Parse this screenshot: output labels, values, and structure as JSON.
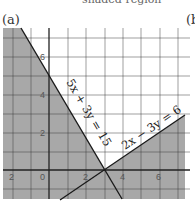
{
  "header": {
    "top_text": "shaded region",
    "panel_a_label": "(a)",
    "panel_b_label": "(b"
  },
  "colors": {
    "shade": "#a8a8a8",
    "grid": "#3a3a3a",
    "line": "#1a1a1a",
    "background": "#ffffff"
  },
  "graph": {
    "x_ticks": [
      "2",
      "0",
      "2",
      "4",
      "6"
    ],
    "y_ticks": [
      "6",
      "4",
      "2"
    ],
    "lines": [
      {
        "label": "5x + 3y = 15"
      },
      {
        "label": "2x − 3y = 6"
      }
    ]
  }
}
